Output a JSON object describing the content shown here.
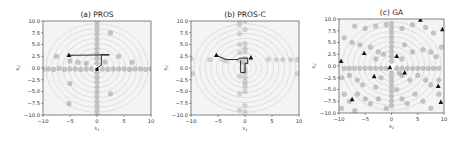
{
  "chart_data": [
    {
      "type": "scatter",
      "title": "(a) PROS",
      "xlabel": "x1",
      "ylabel": "x2",
      "xlim": [
        -10,
        10
      ],
      "ylim": [
        -10,
        10
      ],
      "xticks": [
        "-10",
        "-5",
        "0",
        "5",
        "10"
      ],
      "yticks": [
        "10.0",
        "7.5",
        "5.0",
        "2.5",
        "0.0",
        "-2.5",
        "-5.0",
        "-7.5",
        "-10.0"
      ],
      "background": "concentric contour rings centered at (0,0)",
      "grid": false,
      "series": [
        {
          "name": "samples",
          "marker": "circle",
          "color": "#9a9a9a",
          "points": [
            [
              -10,
              -0.3
            ],
            [
              -9,
              -0.2
            ],
            [
              -8,
              -0.3
            ],
            [
              -7,
              -0.1
            ],
            [
              -6,
              -0.3
            ],
            [
              -5,
              -0.2
            ],
            [
              -4,
              -0.2
            ],
            [
              -3,
              -0.3
            ],
            [
              -2,
              -0.2
            ],
            [
              -1,
              -0.2
            ],
            [
              1,
              -0.2
            ],
            [
              2,
              -0.3
            ],
            [
              3,
              -0.2
            ],
            [
              4,
              -0.2
            ],
            [
              5,
              -0.2
            ],
            [
              6,
              -0.3
            ],
            [
              7,
              -0.2
            ],
            [
              8,
              -0.2
            ],
            [
              9,
              -0.3
            ],
            [
              10,
              -0.2
            ],
            [
              0,
              10
            ],
            [
              0,
              9
            ],
            [
              0,
              8
            ],
            [
              0,
              7
            ],
            [
              0,
              6
            ],
            [
              0,
              5
            ],
            [
              0,
              4
            ],
            [
              0,
              3
            ],
            [
              0,
              2
            ],
            [
              0,
              1
            ],
            [
              0,
              -1
            ],
            [
              0,
              -2
            ],
            [
              0,
              -3
            ],
            [
              0,
              -4
            ],
            [
              0,
              -5
            ],
            [
              0,
              -6
            ],
            [
              0,
              -7
            ],
            [
              0,
              -8
            ],
            [
              0,
              -9
            ],
            [
              0,
              -10
            ],
            [
              -7.5,
              2.5
            ],
            [
              -5,
              1.5
            ],
            [
              -3.5,
              1.2
            ],
            [
              2.5,
              7.5
            ],
            [
              4,
              2.5
            ],
            [
              6.5,
              1.2
            ],
            [
              -5,
              -3.3
            ],
            [
              -5.2,
              -7.6
            ],
            [
              2.5,
              -5.5
            ],
            [
              -2,
              1
            ],
            [
              1.5,
              1.3
            ]
          ]
        },
        {
          "name": "search path",
          "marker": "line",
          "color": "#111111",
          "points": [
            [
              -5.2,
              2.7
            ],
            [
              2.3,
              2.8
            ],
            [
              0.8,
              2.8
            ],
            [
              0.8,
              0.6
            ],
            [
              0,
              0
            ]
          ]
        },
        {
          "name": "start/best",
          "marker": "triangle",
          "color": "#111111",
          "points": [
            [
              -5.2,
              2.7
            ]
          ]
        },
        {
          "name": "optimum",
          "marker": "square",
          "color": "#111111",
          "points": [
            [
              0,
              -0.3
            ]
          ]
        }
      ]
    },
    {
      "type": "scatter",
      "title": "(b) PROS-C",
      "xlabel": "x1",
      "ylabel": "x2",
      "xlim": [
        -10,
        10
      ],
      "ylim": [
        -10,
        10
      ],
      "xticks": [
        "-10",
        "-5",
        "0",
        "5",
        "10"
      ],
      "yticks": [
        "10.0",
        "7.5",
        "5.0",
        "2.5",
        "0.0",
        "-2.5",
        "-5.0",
        "-7.5",
        "-10.0"
      ],
      "background": "concentric contour rings centered at (0,0)",
      "grid": false,
      "series": [
        {
          "name": "samples",
          "marker": "circle",
          "color": "#b5b5b5",
          "points": [
            [
              -10,
              2
            ],
            [
              -6.5,
              1.8
            ],
            [
              -4.2,
              1.8
            ],
            [
              -3.5,
              1.5
            ],
            [
              -1,
              1.6
            ],
            [
              -0.5,
              1.2
            ],
            [
              4.3,
              1.8
            ],
            [
              5.8,
              1.8
            ],
            [
              7,
              1.8
            ],
            [
              8.5,
              1.8
            ],
            [
              9.7,
              1.8
            ],
            [
              -9.7,
              -1.2
            ],
            [
              9.7,
              -1.2
            ],
            [
              -1,
              10
            ],
            [
              0,
              10
            ],
            [
              -1,
              9.2
            ],
            [
              0,
              8.2
            ],
            [
              -1,
              7.3
            ],
            [
              0,
              5.2
            ],
            [
              -1,
              5
            ],
            [
              0,
              4.2
            ],
            [
              0,
              3.5
            ],
            [
              -1,
              3.3
            ],
            [
              0,
              2
            ],
            [
              0,
              1
            ],
            [
              0,
              0
            ],
            [
              0,
              -0.5
            ],
            [
              0,
              -1
            ],
            [
              0,
              -2
            ],
            [
              -1,
              -1.8
            ],
            [
              0,
              -2.8
            ],
            [
              0,
              -3.3
            ],
            [
              0,
              -4
            ],
            [
              -1,
              -5.5
            ],
            [
              0,
              -5
            ],
            [
              0,
              -8
            ],
            [
              -1,
              -9
            ],
            [
              0,
              -9.3
            ]
          ]
        },
        {
          "name": "search path",
          "marker": "line",
          "color": "#111111",
          "points": [
            [
              -5.3,
              2.7
            ],
            [
              -3.5,
              1.8
            ],
            [
              -1.3,
              1.8
            ],
            [
              -1,
              2.1
            ],
            [
              0.5,
              2.1
            ],
            [
              0.5,
              1
            ],
            [
              0,
              1
            ],
            [
              0,
              -1
            ],
            [
              -0.8,
              -1
            ],
            [
              -0.8,
              1.6
            ]
          ]
        },
        {
          "name": "start/best",
          "marker": "triangle",
          "color": "#111111",
          "points": [
            [
              -5.3,
              2.7
            ],
            [
              1.1,
              2.2
            ]
          ]
        }
      ]
    },
    {
      "type": "scatter",
      "title": "(c) GA",
      "xlabel": "x1",
      "ylabel": "x2",
      "xlim": [
        -10,
        10
      ],
      "ylim": [
        -10,
        10
      ],
      "xticks": [
        "-10",
        "-5",
        "0",
        "5",
        "10"
      ],
      "yticks": [
        "10.0",
        "7.5",
        "5.0",
        "2.5",
        "0.0",
        "-2.5",
        "-5.0",
        "-7.5",
        "-10.0"
      ],
      "background": "concentric contour rings centered at (0,0)",
      "grid": false,
      "series": [
        {
          "name": "samples",
          "marker": "circle",
          "color": "#9a9a9a",
          "points": [
            [
              -9,
              -0.5
            ],
            [
              -8,
              -0.5
            ],
            [
              -7,
              -0.5
            ],
            [
              -6,
              -0.5
            ],
            [
              -5,
              -0.5
            ],
            [
              -4,
              -0.5
            ],
            [
              -3,
              -0.5
            ],
            [
              -2,
              -0.5
            ],
            [
              -1,
              -0.5
            ],
            [
              1,
              -0.5
            ],
            [
              2,
              -0.5
            ],
            [
              3,
              -0.5
            ],
            [
              4,
              -0.5
            ],
            [
              5,
              -0.5
            ],
            [
              6,
              -0.5
            ],
            [
              7,
              -0.5
            ],
            [
              8,
              -0.5
            ],
            [
              9,
              -0.5
            ],
            [
              0,
              9
            ],
            [
              0,
              8
            ],
            [
              0,
              7
            ],
            [
              0,
              6
            ],
            [
              0,
              5
            ],
            [
              0,
              4
            ],
            [
              0,
              3
            ],
            [
              0,
              2
            ],
            [
              0,
              1
            ],
            [
              0,
              -1.5
            ],
            [
              0,
              -2.5
            ],
            [
              0,
              -3.5
            ],
            [
              0,
              -4.5
            ],
            [
              0,
              -5.5
            ],
            [
              0,
              -6.5
            ],
            [
              0,
              -7.5
            ],
            [
              0,
              -8.5
            ],
            [
              -7,
              8.5
            ],
            [
              -5,
              8
            ],
            [
              -3,
              8.5
            ],
            [
              -1,
              8.8
            ],
            [
              2,
              8
            ],
            [
              4,
              8.8
            ],
            [
              6.5,
              8.2
            ],
            [
              8,
              7
            ],
            [
              -9,
              6
            ],
            [
              -7.5,
              5
            ],
            [
              -6,
              4.5
            ],
            [
              -4,
              4
            ],
            [
              -2.5,
              3
            ],
            [
              2.5,
              4.5
            ],
            [
              4,
              3
            ],
            [
              6,
              3.5
            ],
            [
              7.5,
              3
            ],
            [
              8.5,
              2
            ],
            [
              9.5,
              4
            ],
            [
              -9.5,
              -2.5
            ],
            [
              -8,
              -2
            ],
            [
              -6.5,
              -3
            ],
            [
              -5.5,
              -4
            ],
            [
              -3,
              -4.5
            ],
            [
              -2,
              -2.5
            ],
            [
              2,
              -2
            ],
            [
              3.5,
              -3
            ],
            [
              5,
              -2
            ],
            [
              6.5,
              -3
            ],
            [
              7.5,
              -4
            ],
            [
              9,
              -3
            ],
            [
              -9,
              -6
            ],
            [
              -8,
              -7.5
            ],
            [
              -6.5,
              -6
            ],
            [
              -5,
              -7
            ],
            [
              -4,
              -8
            ],
            [
              -2.5,
              -7
            ],
            [
              -1,
              -9
            ],
            [
              2,
              -7
            ],
            [
              3,
              -8
            ],
            [
              4.5,
              -6
            ],
            [
              6,
              -7.5
            ],
            [
              7.5,
              -9
            ],
            [
              9,
              -6
            ],
            [
              -9.5,
              -9
            ],
            [
              -7,
              -9.5
            ],
            [
              1,
              -5
            ],
            [
              -3,
              1.5
            ],
            [
              2,
              1.5
            ],
            [
              -1.5,
              2.5
            ],
            [
              1.5,
              -1.5
            ]
          ]
        },
        {
          "name": "elite",
          "marker": "triangle",
          "color": "#111111",
          "points": [
            [
              5.5,
              9.8
            ],
            [
              9.7,
              7.8
            ],
            [
              -5.2,
              2.7
            ],
            [
              1,
              2.1
            ],
            [
              -9.6,
              1
            ],
            [
              2.5,
              -1.4
            ],
            [
              -3.3,
              -2.2
            ],
            [
              8.9,
              -4.3
            ],
            [
              -7.5,
              -7.1
            ],
            [
              9.4,
              -7.7
            ],
            [
              -0.3,
              -0.3
            ]
          ]
        }
      ]
    }
  ]
}
